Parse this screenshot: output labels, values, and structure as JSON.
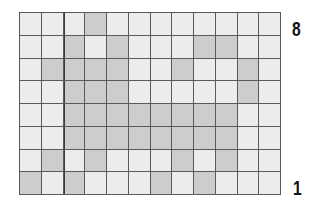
{
  "grid": {
    "columns": 12,
    "rows": 8,
    "colors": {
      "off": "#ececec",
      "on": "#cdcdcd",
      "line": "#5a5a5a"
    },
    "cells": [
      [
        0,
        0,
        0,
        1,
        0,
        0,
        0,
        0,
        0,
        0,
        0,
        0
      ],
      [
        0,
        0,
        1,
        0,
        1,
        0,
        0,
        0,
        1,
        1,
        0,
        0
      ],
      [
        0,
        1,
        1,
        1,
        1,
        0,
        0,
        1,
        0,
        0,
        1,
        0
      ],
      [
        0,
        0,
        1,
        1,
        1,
        0,
        0,
        0,
        0,
        0,
        1,
        0
      ],
      [
        0,
        0,
        1,
        1,
        1,
        1,
        1,
        1,
        1,
        1,
        0,
        0
      ],
      [
        0,
        0,
        1,
        1,
        1,
        1,
        1,
        1,
        1,
        1,
        0,
        0
      ],
      [
        0,
        1,
        0,
        1,
        0,
        0,
        0,
        1,
        0,
        1,
        0,
        0
      ],
      [
        1,
        0,
        1,
        0,
        0,
        0,
        1,
        0,
        1,
        0,
        0,
        0
      ]
    ]
  },
  "labels": {
    "top": "8",
    "bottom": "1"
  }
}
